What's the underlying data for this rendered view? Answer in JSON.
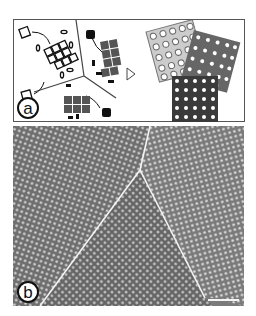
{
  "figure": {
    "panel_a": {
      "label": "a",
      "description": "Schematic of three types of tiles self-assembling into separate crystalline domains",
      "arrow_symbol": "▷"
    },
    "panel_b": {
      "label": "b",
      "description": "Micrograph showing three crystalline domains separated by grain boundaries",
      "scale_bar": ""
    }
  }
}
